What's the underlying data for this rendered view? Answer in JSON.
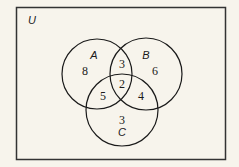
{
  "diagram": {
    "type": "venn",
    "universe_label": "U",
    "sets": [
      {
        "id": "A",
        "label": "A"
      },
      {
        "id": "B",
        "label": "B"
      },
      {
        "id": "C",
        "label": "C"
      }
    ],
    "regions": {
      "A_only": "8",
      "B_only": "6",
      "C_only": "3",
      "A_and_B_only": "3",
      "A_and_C_only": "5",
      "B_and_C_only": "4",
      "A_and_B_and_C": "2"
    },
    "colors": {
      "background": "#f7f4ec",
      "stroke": "#1a1a1a"
    }
  }
}
